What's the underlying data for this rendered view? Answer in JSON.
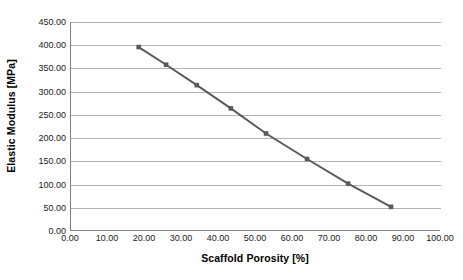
{
  "chart_data": {
    "type": "line",
    "title": "",
    "xlabel": "Scaffold Porosity [%]",
    "ylabel": "Elastic Modulus [MPa]",
    "xlim": [
      0,
      100
    ],
    "ylim": [
      0,
      450
    ],
    "grid": true,
    "legend": "none",
    "x_ticks": [
      "0.00",
      "10.00",
      "20.00",
      "30.00",
      "40.00",
      "50.00",
      "60.00",
      "70.00",
      "80.00",
      "90.00",
      "100.00"
    ],
    "y_ticks": [
      "0.00",
      "50.00",
      "100.00",
      "150.00",
      "200.00",
      "250.00",
      "300.00",
      "350.00",
      "400.00",
      "450.00"
    ],
    "x_tick_values": [
      0,
      10,
      20,
      30,
      40,
      50,
      60,
      70,
      80,
      90,
      100
    ],
    "y_tick_values": [
      0,
      50,
      100,
      150,
      200,
      250,
      300,
      350,
      400,
      450
    ],
    "series": [
      {
        "name": "Elastic Modulus",
        "color": "#595959",
        "marker": "square",
        "x": [
          18.3,
          25.7,
          34.0,
          43.2,
          52.7,
          63.8,
          74.9,
          86.5
        ],
        "y": [
          396,
          358,
          314,
          264,
          210,
          155,
          102,
          52
        ]
      }
    ]
  },
  "axes": {
    "x_title": "Scaffold Porosity [%]",
    "y_title": "Elastic Modulus [MPa]"
  },
  "colors": {
    "series": "#595959",
    "gridline": "#b3b3b3",
    "axis": "#808080",
    "background": "#ffffff",
    "text": "#000000"
  }
}
